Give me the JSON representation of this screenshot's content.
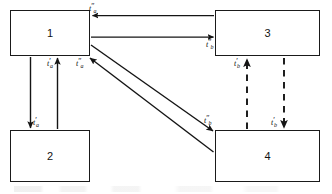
{
  "diagram": {
    "type": "block-diagram",
    "canvas": {
      "width": 332,
      "height": 194,
      "background": "#ffffff"
    },
    "line_color": "#141414",
    "nodes": [
      {
        "id": "node-1",
        "label": "1",
        "x": 10,
        "y": 10,
        "width": 80,
        "height": 46
      },
      {
        "id": "node-2",
        "label": "2",
        "x": 10,
        "y": 130,
        "width": 80,
        "height": 52
      },
      {
        "id": "node-3",
        "label": "3",
        "x": 215,
        "y": 10,
        "width": 105,
        "height": 46
      },
      {
        "id": "node-4",
        "label": "4",
        "x": 215,
        "y": 130,
        "width": 105,
        "height": 52
      }
    ],
    "edges": [
      {
        "id": "edge-3-to-1",
        "from": "node-3",
        "to": "node-1",
        "style": "solid",
        "direction": "right-to-left",
        "label": "t''a",
        "label_base": "t",
        "label_primes": "″",
        "label_sub": "a"
      },
      {
        "id": "edge-1-to-3",
        "from": "node-1",
        "to": "node-3",
        "style": "solid",
        "direction": "left-to-right",
        "label": "t''b",
        "label_base": "t",
        "label_primes": "″",
        "label_sub": "b"
      },
      {
        "id": "edge-1-to-2",
        "from": "node-1",
        "to": "node-2",
        "style": "solid",
        "direction": "down",
        "label": "t'a",
        "label_base": "t",
        "label_primes": "′",
        "label_sub": "a"
      },
      {
        "id": "edge-2-to-1",
        "from": "node-2",
        "to": "node-1",
        "style": "solid",
        "direction": "up",
        "label": "t'a",
        "label_base": "t",
        "label_primes": "′",
        "label_sub": "a"
      },
      {
        "id": "edge-1-to-4",
        "from": "node-1",
        "to": "node-4",
        "style": "solid",
        "direction": "diagonal-down-right",
        "label": "t''b",
        "label_base": "t",
        "label_primes": "″",
        "label_sub": "b"
      },
      {
        "id": "edge-4-to-1",
        "from": "node-4",
        "to": "node-1",
        "style": "solid",
        "direction": "diagonal-up-left",
        "label": "t''a",
        "label_base": "t",
        "label_primes": "″",
        "label_sub": "a"
      },
      {
        "id": "edge-4-to-3",
        "from": "node-4",
        "to": "node-3",
        "style": "dashed",
        "direction": "up",
        "label": "t'b",
        "label_base": "t",
        "label_primes": "′",
        "label_sub": "b"
      },
      {
        "id": "edge-3-to-4",
        "from": "node-3",
        "to": "node-4",
        "style": "dashed",
        "direction": "down",
        "label": "t'b",
        "label_base": "t",
        "label_primes": "′",
        "label_sub": "b"
      }
    ]
  }
}
